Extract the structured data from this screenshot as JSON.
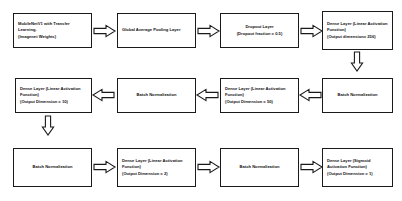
{
  "diagram": {
    "flow_direction": "serpentine: row 1 left-to-right, row 2 right-to-left, row 3 left-to-right",
    "stroke_color": "#1a1a1a",
    "background_color": "#ffffff",
    "nodes": [
      {
        "id": "base-model",
        "label": "MobileNetV1 with Transfer Learning.\n(Imagenet Weights)",
        "align": "left"
      },
      {
        "id": "global-average-pooling",
        "label": "Global Average Pooling Layer",
        "align": "left"
      },
      {
        "id": "dropout",
        "label": "Dropout Layer\n(Dropout fraction = 0.5)",
        "align": "center"
      },
      {
        "id": "dense-256",
        "label": "Dense Layer (Linear Activation Function)\n(Output dimension= 256)",
        "align": "left"
      },
      {
        "id": "batch-norm-1",
        "label": "Batch Normalization",
        "align": "center"
      },
      {
        "id": "dense-50",
        "label": "Dense Layer (Linear Activation Function)\n(Output Dimension = 50)",
        "align": "left"
      },
      {
        "id": "batch-norm-2",
        "label": "Batch Normalization",
        "align": "center"
      },
      {
        "id": "dense-10",
        "label": "Dense Layer (Linear Activation Function)\n(Output Dimension = 10)",
        "align": "left"
      },
      {
        "id": "batch-norm-3",
        "label": "Batch Normalization",
        "align": "center"
      },
      {
        "id": "dense-2",
        "label": "Dense Layer (Linear Activation Function)\n(Output Dimension = 2)",
        "align": "left"
      },
      {
        "id": "batch-norm-4",
        "label": "Batch Normalization",
        "align": "center"
      },
      {
        "id": "dense-1-sigmoid",
        "label": "Dense Layer (Sigmoid Activation Function)\n(Output Dimension = 1)",
        "align": "left"
      }
    ],
    "connectors": [
      {
        "id": "base-model-to-global-average-pooling",
        "direction": "right"
      },
      {
        "id": "global-average-pooling-to-dropout",
        "direction": "right"
      },
      {
        "id": "dropout-to-dense-256",
        "direction": "right"
      },
      {
        "id": "dense-256-to-batch-norm-1",
        "direction": "down"
      },
      {
        "id": "batch-norm-1-to-dense-50",
        "direction": "left"
      },
      {
        "id": "dense-50-to-batch-norm-2",
        "direction": "left"
      },
      {
        "id": "batch-norm-2-to-dense-10",
        "direction": "left"
      },
      {
        "id": "dense-10-to-batch-norm-3",
        "direction": "down"
      },
      {
        "id": "batch-norm-3-to-dense-2",
        "direction": "right"
      },
      {
        "id": "dense-2-to-batch-norm-4",
        "direction": "right"
      },
      {
        "id": "batch-norm-4-to-dense-1-sigmoid",
        "direction": "right"
      }
    ]
  }
}
